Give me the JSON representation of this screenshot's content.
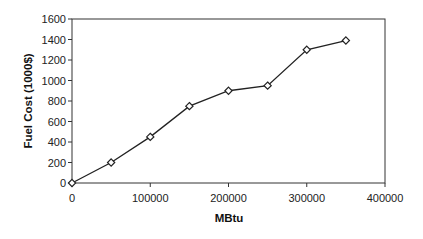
{
  "chart_data": {
    "type": "line",
    "title": "",
    "xlabel": "MBtu",
    "ylabel": "Fuel Cost (1000$)",
    "xlim": [
      0,
      400000
    ],
    "ylim": [
      0,
      1600
    ],
    "x_ticks": [
      0,
      100000,
      200000,
      300000,
      400000
    ],
    "x_tick_labels": [
      "0",
      "100000",
      "200000",
      "300000",
      "400000"
    ],
    "y_ticks": [
      0,
      200,
      400,
      600,
      800,
      1000,
      1200,
      1400,
      1600
    ],
    "y_tick_labels": [
      "0",
      "200",
      "400",
      "600",
      "800",
      "1000",
      "1200",
      "1400",
      "1600"
    ],
    "grid": false,
    "legend": null,
    "series": [
      {
        "name": "Fuel Cost",
        "marker": "hollow-diamond",
        "color": "#222222",
        "x": [
          0,
          50000,
          100000,
          150000,
          200000,
          250000,
          300000,
          350000
        ],
        "values": [
          0,
          200,
          450,
          750,
          900,
          950,
          1300,
          1390
        ]
      }
    ]
  },
  "colors": {
    "background": "#ffffff",
    "axis": "#333333",
    "line": "#222222",
    "marker_fill": "#ffffff"
  }
}
